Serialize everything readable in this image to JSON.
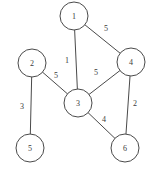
{
  "chart_data": {
    "type": "diagram",
    "title": "",
    "subtitle": "",
    "xlabel": "",
    "ylabel": "",
    "graph_kind": "undirected weighted graph",
    "nodes": [
      {
        "id": "1",
        "label": "1",
        "cx": 74,
        "cy": 16,
        "r": 14
      },
      {
        "id": "2",
        "label": "2",
        "cx": 32,
        "cy": 63,
        "r": 14
      },
      {
        "id": "3",
        "label": "3",
        "cx": 78,
        "cy": 103,
        "r": 14
      },
      {
        "id": "4",
        "label": "4",
        "cx": 131,
        "cy": 62,
        "r": 14
      },
      {
        "id": "5",
        "label": "5",
        "cx": 30,
        "cy": 148,
        "r": 14
      },
      {
        "id": "6",
        "label": "6",
        "cx": 125,
        "cy": 148,
        "r": 14
      }
    ],
    "edges": [
      {
        "source": "1",
        "target": "4",
        "weight": "5",
        "lx": 106,
        "ly": 28
      },
      {
        "source": "1",
        "target": "3",
        "weight": "1",
        "lx": 67,
        "ly": 60
      },
      {
        "source": "2",
        "target": "3",
        "weight": "5",
        "lx": 56,
        "ly": 75
      },
      {
        "source": "3",
        "target": "4",
        "weight": "5",
        "lx": 96,
        "ly": 72
      },
      {
        "source": "2",
        "target": "5",
        "weight": "3",
        "lx": 22,
        "ly": 106
      },
      {
        "source": "3",
        "target": "6",
        "weight": "4",
        "lx": 104,
        "ly": 119
      },
      {
        "source": "4",
        "target": "6",
        "weight": "2",
        "lx": 135,
        "ly": 103
      }
    ],
    "colors": {
      "stroke": "#4a4a4a",
      "node_fill": "#ffffff",
      "text": "#3a3a3a",
      "background": "#ffffff"
    }
  }
}
